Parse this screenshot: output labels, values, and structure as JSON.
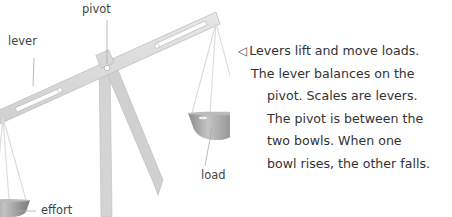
{
  "labels": {
    "pivot": "pivot",
    "lever": "lever",
    "load": "load",
    "effort": "effort"
  },
  "caption": {
    "arrow_icon": "◁",
    "lines": [
      "Levers lift and move loads.",
      "The lever balances on the",
      "pivot. Scales are levers.",
      "The pivot is between the",
      "two bowls. When one",
      "bowl rises, the other falls."
    ]
  },
  "colors": {
    "metal": "#d9d9d9",
    "metal_dark": "#b5b5b5",
    "bowl": "#9a9a9a",
    "text": "#333333"
  }
}
